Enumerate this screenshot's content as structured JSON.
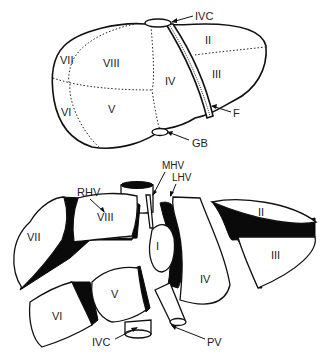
{
  "diagram": {
    "top_view": {
      "segments": [
        {
          "id": "VII",
          "label": "VII"
        },
        {
          "id": "VIII",
          "label": "VIII"
        },
        {
          "id": "VI",
          "label": "VI"
        },
        {
          "id": "V",
          "label": "V"
        },
        {
          "id": "IV",
          "label": "IV"
        },
        {
          "id": "II",
          "label": "II"
        },
        {
          "id": "III",
          "label": "III"
        }
      ],
      "callouts": [
        {
          "id": "ivc",
          "label": "IVC"
        },
        {
          "id": "f",
          "label": "F"
        },
        {
          "id": "gb",
          "label": "GB"
        }
      ]
    },
    "exploded_view": {
      "segments": [
        {
          "id": "VII",
          "label": "VII"
        },
        {
          "id": "VIII",
          "label": "VIII"
        },
        {
          "id": "I",
          "label": "I"
        },
        {
          "id": "IV",
          "label": "IV"
        },
        {
          "id": "II",
          "label": "II"
        },
        {
          "id": "III",
          "label": "III"
        },
        {
          "id": "VI",
          "label": "VI"
        },
        {
          "id": "V",
          "label": "V"
        }
      ],
      "callouts": [
        {
          "id": "rhv",
          "label": "RHV"
        },
        {
          "id": "mhv",
          "label": "MHV"
        },
        {
          "id": "lhv",
          "label": "LHV"
        },
        {
          "id": "ivc",
          "label": "IVC"
        },
        {
          "id": "pv",
          "label": "PV"
        }
      ]
    }
  }
}
